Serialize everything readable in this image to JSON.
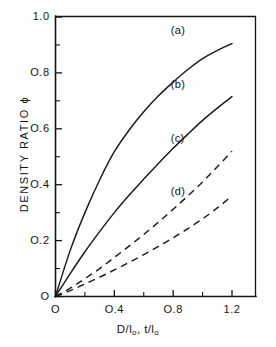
{
  "chart_data": {
    "type": "line",
    "title": "",
    "xlabel": "D/l₀, t/l₀",
    "ylabel": "DENSITY RATIO ϕ",
    "xlim": [
      0,
      1.3
    ],
    "ylim": [
      0,
      1.0
    ],
    "grid": false,
    "legend_position": "inline-annotations",
    "x_ticks": [
      {
        "value": 0,
        "label": "O",
        "major": true
      },
      {
        "value": 0.2,
        "label": "",
        "major": false
      },
      {
        "value": 0.4,
        "label": "O.4",
        "major": true
      },
      {
        "value": 0.6,
        "label": "",
        "major": false
      },
      {
        "value": 0.8,
        "label": "O.8",
        "major": true
      },
      {
        "value": 1.0,
        "label": "",
        "major": false
      },
      {
        "value": 1.2,
        "label": "1.2",
        "major": true
      }
    ],
    "y_ticks": [
      {
        "value": 0,
        "label": "O",
        "major": true
      },
      {
        "value": 0.1,
        "label": "",
        "major": false
      },
      {
        "value": 0.2,
        "label": "O.2",
        "major": true
      },
      {
        "value": 0.3,
        "label": "",
        "major": false
      },
      {
        "value": 0.4,
        "label": "O.4",
        "major": true
      },
      {
        "value": 0.5,
        "label": "",
        "major": false
      },
      {
        "value": 0.6,
        "label": "O.6",
        "major": true
      },
      {
        "value": 0.7,
        "label": "",
        "major": false
      },
      {
        "value": 0.8,
        "label": "O.8",
        "major": true
      },
      {
        "value": 0.9,
        "label": "",
        "major": false
      },
      {
        "value": 1.0,
        "label": "1.0",
        "major": true
      }
    ],
    "x": [
      0,
      0.1,
      0.2,
      0.3,
      0.4,
      0.5,
      0.6,
      0.7,
      0.8,
      0.9,
      1.0,
      1.1,
      1.2
    ],
    "series": [
      {
        "name": "(a)",
        "style": "solid",
        "label_x": 0.92,
        "label_y": 0.95,
        "values": [
          0,
          0.165,
          0.3,
          0.417,
          0.518,
          0.595,
          0.661,
          0.718,
          0.767,
          0.812,
          0.851,
          0.88,
          0.905
        ]
      },
      {
        "name": "(b)",
        "style": "solid",
        "label_x": 0.92,
        "label_y": 0.755,
        "values": [
          0,
          0.082,
          0.16,
          0.232,
          0.3,
          0.362,
          0.42,
          0.476,
          0.53,
          0.581,
          0.63,
          0.674,
          0.715
        ]
      },
      {
        "name": "(c)",
        "style": "dashed",
        "label_x": 0.92,
        "label_y": 0.565,
        "values": [
          0,
          0.03,
          0.064,
          0.1,
          0.14,
          0.18,
          0.222,
          0.266,
          0.312,
          0.36,
          0.41,
          0.464,
          0.52
        ]
      },
      {
        "name": "(d)",
        "style": "dashed",
        "label_x": 0.92,
        "label_y": 0.375,
        "values": [
          0,
          0.021,
          0.045,
          0.069,
          0.095,
          0.122,
          0.15,
          0.179,
          0.21,
          0.243,
          0.278,
          0.317,
          0.36
        ]
      }
    ]
  },
  "axes": {
    "y_title": "DENSITY RATIO ϕ",
    "x_title_main": "D/l",
    "x_title_sub1": "o",
    "x_title_mid": ", t/l",
    "x_title_sub2": "o"
  }
}
